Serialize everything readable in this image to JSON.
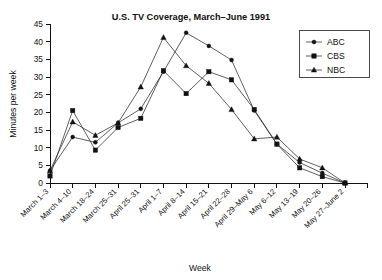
{
  "chart_data": {
    "type": "line",
    "title": "U.S. TV Coverage, March–June 1991",
    "xlabel": "Week",
    "ylabel": "Minutes per week",
    "ylim": [
      0,
      45
    ],
    "yticks": [
      0,
      5,
      10,
      15,
      20,
      25,
      30,
      35,
      40,
      45
    ],
    "grid": false,
    "legend_position": "top-right",
    "categories": [
      "March 1–3",
      "March 4–10",
      "March 18–24",
      "March 25–31",
      "April 25–31",
      "April 1–7",
      "April 8–14",
      "April 15–21",
      "April 22–28",
      "April 29–May 6",
      "May 6–12",
      "May 13–19",
      "May 20–26",
      "May 27–June 2"
    ],
    "series": [
      {
        "name": "ABC",
        "marker": "dot",
        "values": [
          3.5,
          13.0,
          11.5,
          17.0,
          21.0,
          31.5,
          42.5,
          38.8,
          34.8,
          20.5,
          11.0,
          5.8,
          2.8,
          0.0
        ]
      },
      {
        "name": "CBS",
        "marker": "square",
        "values": [
          2.0,
          20.5,
          9.3,
          15.7,
          18.3,
          31.8,
          25.3,
          31.5,
          29.2,
          20.8,
          11.0,
          4.3,
          1.8,
          0.0
        ]
      },
      {
        "name": "NBC",
        "marker": "triangle",
        "values": [
          3.5,
          17.3,
          13.5,
          17.0,
          27.2,
          41.2,
          33.2,
          28.2,
          20.8,
          12.5,
          13.0,
          6.8,
          4.3,
          0.0
        ]
      }
    ]
  },
  "legend": {
    "items": [
      {
        "label": "ABC"
      },
      {
        "label": "CBS"
      },
      {
        "label": "NBC"
      }
    ]
  },
  "colors": {
    "ink": "#111111",
    "line": "#2b2b2b",
    "background": "#ffffff"
  }
}
